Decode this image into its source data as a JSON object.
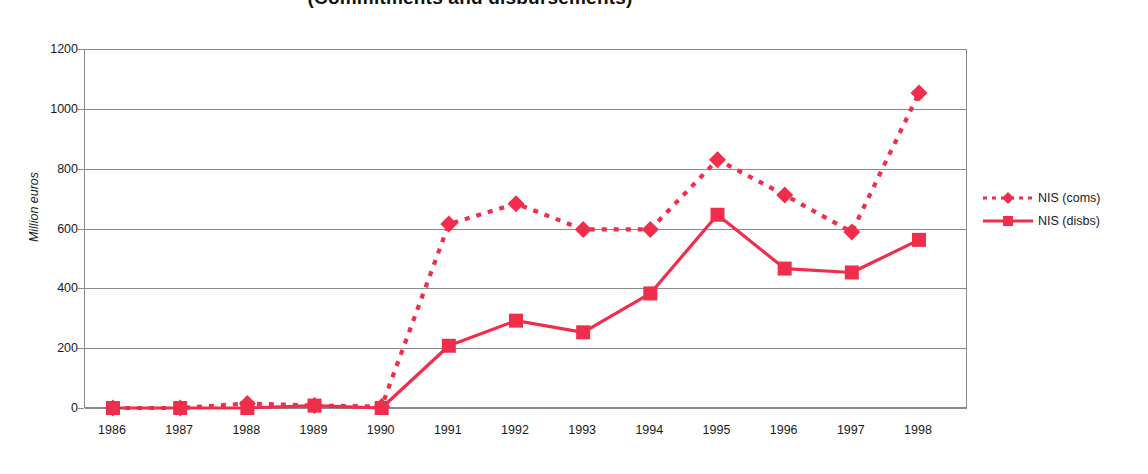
{
  "chart_data": {
    "type": "line",
    "title": "(Commitments and disbursements)",
    "xlabel": "",
    "ylabel": "Million euros",
    "ylim": [
      0,
      1200
    ],
    "ytick_step": 200,
    "yticks": [
      "0",
      "200",
      "400",
      "600",
      "800",
      "1000",
      "1200"
    ],
    "grid": "horizontal",
    "legend_position": "right",
    "categories": [
      "1986",
      "1987",
      "1988",
      "1989",
      "1990",
      "1991",
      "1992",
      "1993",
      "1994",
      "1995",
      "1996",
      "1997",
      "1998"
    ],
    "series": [
      {
        "name": "NIS (coms)",
        "marker": "diamond",
        "line_style": "dotted",
        "color": "#F02D4B",
        "values": [
          0,
          0,
          15,
          8,
          5,
          615,
          683,
          597,
          597,
          830,
          712,
          588,
          1053
        ]
      },
      {
        "name": "NIS (disbs)",
        "marker": "square",
        "line_style": "solid",
        "color": "#F02D4B",
        "values": [
          0,
          0,
          0,
          8,
          0,
          208,
          292,
          253,
          383,
          646,
          466,
          453,
          562
        ]
      }
    ]
  },
  "axis": {
    "y_title": "Million euros"
  },
  "legend": {
    "items": [
      {
        "label": "NIS (coms)"
      },
      {
        "label": "NIS (disbs)"
      }
    ]
  },
  "colors": {
    "series": "#F02D4B",
    "gridline": "#8a8a8a",
    "axis": "#8a8a8a",
    "text": "#1a1a1a"
  }
}
